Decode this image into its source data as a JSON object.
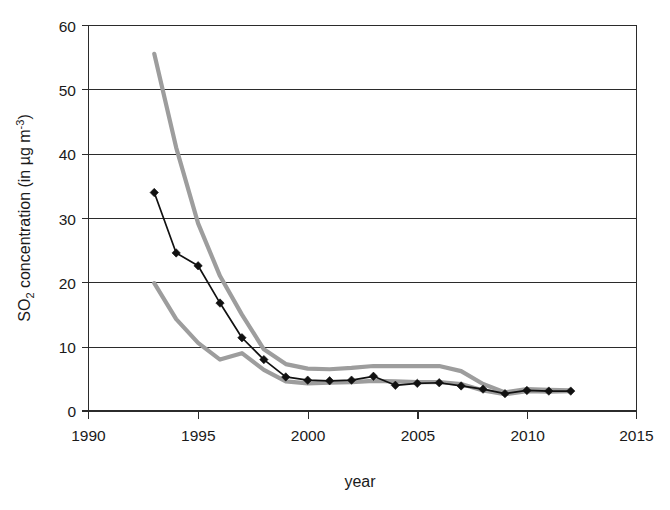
{
  "chart_data": {
    "type": "line",
    "title": "",
    "xlabel": "year",
    "ylabel_parts": {
      "lead": "SO",
      "sub": "2",
      "mid": " concentration (in µg m",
      "sup": "-3",
      "tail": ")"
    },
    "ylabel": "SO2 concentration (in µg m-3)",
    "xlim": [
      1990,
      2015
    ],
    "ylim": [
      0,
      60
    ],
    "xticks": [
      1990,
      1995,
      2000,
      2005,
      2010,
      2015
    ],
    "xtick_labels": [
      "1990",
      "1995",
      "2000",
      "2005",
      "2010",
      "2015"
    ],
    "yticks": [
      0,
      10,
      20,
      30,
      40,
      50,
      60
    ],
    "ytick_labels": [
      "0",
      "10",
      "20",
      "30",
      "40",
      "50",
      "60"
    ],
    "grid": "horizontal",
    "legend_position": "none",
    "series": [
      {
        "name": "mean SO2 concentration",
        "style": "black line with diamond markers",
        "color": "#111111",
        "marker": "diamond",
        "x": [
          1993,
          1994,
          1995,
          1996,
          1997,
          1998,
          1999,
          2000,
          2001,
          2002,
          2003,
          2004,
          2005,
          2006,
          2007,
          2008,
          2009,
          2010,
          2011,
          2012
        ],
        "values": [
          34.0,
          24.6,
          22.6,
          16.8,
          11.4,
          8.0,
          5.3,
          4.8,
          4.7,
          4.8,
          5.4,
          4.0,
          4.3,
          4.4,
          3.9,
          3.4,
          2.7,
          3.2,
          3.1,
          3.1
        ]
      },
      {
        "name": "upper bound",
        "style": "grey line",
        "color": "#9d9d9d",
        "marker": "none",
        "x": [
          1993,
          1994,
          1995,
          1996,
          1997,
          1998,
          1999,
          2000,
          2001,
          2002,
          2003,
          2004,
          2005,
          2006,
          2007,
          2008,
          2009,
          2010,
          2011,
          2012
        ],
        "values": [
          55.6,
          41.0,
          29.2,
          21.0,
          15.0,
          9.6,
          7.3,
          6.6,
          6.5,
          6.7,
          7.0,
          7.0,
          7.0,
          7.0,
          6.2,
          4.2,
          2.9,
          3.4,
          3.3,
          3.2
        ]
      },
      {
        "name": "lower bound",
        "style": "grey line",
        "color": "#9d9d9d",
        "marker": "none",
        "x": [
          1993,
          1994,
          1995,
          1996,
          1997,
          1998,
          1999,
          2000,
          2001,
          2002,
          2003,
          2004,
          2005,
          2006,
          2007,
          2008,
          2009,
          2010,
          2011,
          2012
        ],
        "values": [
          19.9,
          14.3,
          10.6,
          8.0,
          9.0,
          6.4,
          4.6,
          4.3,
          4.4,
          4.5,
          4.7,
          4.6,
          4.5,
          4.5,
          4.2,
          3.2,
          2.6,
          3.1,
          3.0,
          3.1
        ]
      }
    ]
  }
}
